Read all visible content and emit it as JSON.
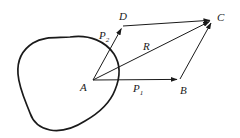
{
  "figure": {
    "background_color": "#ffffff",
    "stroke_color": "#1a1a1a",
    "labels": {
      "vertex_a": "A",
      "vertex_b": "B",
      "vertex_c": "C",
      "vertex_d": "D",
      "vector_p1": "P",
      "vector_p1_sub": "1",
      "vector_p2": "P",
      "vector_p2_sub": "2",
      "resultant_r": "R"
    },
    "geometry": {
      "points": {
        "A": [
          93,
          80
        ],
        "B": [
          180,
          79
        ],
        "C": [
          213,
          19
        ],
        "D": [
          123,
          26
        ]
      },
      "vectors": [
        {
          "name": "P1",
          "from": "A",
          "to": "B",
          "arrow": true
        },
        {
          "name": "P2",
          "from": "A",
          "to": "D",
          "arrow": true
        },
        {
          "name": "R",
          "from": "A",
          "to": "C",
          "arrow": true
        }
      ],
      "closing_sides": [
        {
          "from": "D",
          "to": "C",
          "arrow": true
        },
        {
          "from": "B",
          "to": "C",
          "arrow": true
        }
      ],
      "body_outline": "irregular closed blob at left of A"
    }
  }
}
